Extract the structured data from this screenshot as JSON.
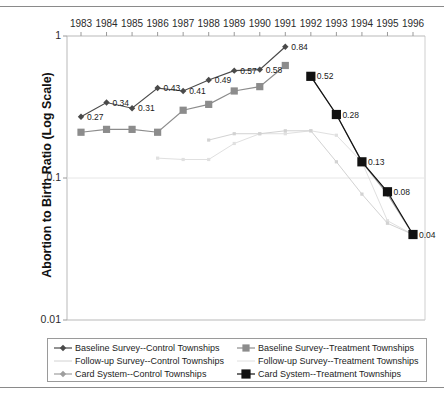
{
  "chart_data": {
    "type": "line",
    "title": "",
    "xlabel": "",
    "ylabel": "Abortion to Birth Ratio (Log Scale)",
    "scale": "log",
    "grid": false,
    "legend_position": "bottom",
    "x": [
      1983,
      1984,
      1985,
      1986,
      1987,
      1988,
      1989,
      1990,
      1991,
      1992,
      1993,
      1994,
      1995,
      1996
    ],
    "xticklabels": [
      "1983",
      "1984",
      "1985",
      "1986",
      "1987",
      "1988",
      "1989",
      "1990",
      "1991",
      "1992",
      "1993",
      "1994",
      "1995",
      "1996"
    ],
    "yticklabels": [
      "1",
      "0.1",
      "0.01"
    ],
    "yticks": [
      1,
      0.1,
      0.01
    ],
    "ylim": [
      0.01,
      1
    ],
    "series": [
      {
        "name": "Baseline Survey--Control Townships",
        "marker": "diamond",
        "color": "#4a4a4a",
        "x": [
          1983,
          1984,
          1985,
          1986,
          1987,
          1988,
          1989,
          1990,
          1991
        ],
        "values": [
          0.27,
          0.34,
          0.31,
          0.43,
          0.41,
          0.49,
          0.57,
          0.58,
          0.84
        ],
        "labels": [
          "0.27",
          "0.34",
          "0.31",
          "0.43",
          "0.41",
          "0.49",
          "0.57",
          "0.58",
          "0.84"
        ]
      },
      {
        "name": "Baseline Survey--Treatment Townships",
        "marker": "square",
        "color": "#8c8c8c",
        "x": [
          1983,
          1984,
          1985,
          1986,
          1987,
          1988,
          1989,
          1990,
          1991
        ],
        "values": [
          0.21,
          0.22,
          0.22,
          0.21,
          0.3,
          0.33,
          0.41,
          0.44,
          0.62
        ],
        "labels": [
          "",
          "",
          "",
          "",
          "",
          "",
          "",
          "",
          ""
        ]
      },
      {
        "name": "Follow-up Survey--Control Townships",
        "marker": "none",
        "color": "#d2d2d2",
        "x": [
          1988,
          1989,
          1990,
          1991,
          1992,
          1993,
          1994,
          1995,
          1996
        ],
        "values": [
          0.185,
          0.205,
          0.205,
          0.215,
          0.215,
          0.13,
          0.077,
          0.048,
          0.04
        ],
        "labels": [
          "",
          "",
          "",
          "",
          "",
          "",
          "",
          "",
          ""
        ]
      },
      {
        "name": "Follow-up Survey--Treatment Townships",
        "marker": "none",
        "color": "#e0e0e0",
        "x": [
          1986,
          1987,
          1988,
          1989,
          1990,
          1991,
          1992,
          1993,
          1994,
          1995,
          1996
        ],
        "values": [
          0.138,
          0.135,
          0.135,
          0.175,
          0.205,
          0.205,
          0.215,
          0.2,
          0.13,
          0.05,
          0.04
        ],
        "labels": [
          "",
          "",
          "",
          "",
          "",
          "",
          "",
          "",
          "",
          "",
          ""
        ]
      },
      {
        "name": "Card System--Control Townships",
        "marker": "diamond",
        "color": "#9e9e9e",
        "x": [
          1992,
          1993,
          1994,
          1995,
          1996
        ],
        "values": [
          0.52,
          0.28,
          0.13,
          0.077,
          0.04
        ],
        "labels": [
          "",
          "",
          "",
          "",
          ""
        ]
      },
      {
        "name": "Card System--Treatment Townships",
        "marker": "square-filled",
        "color": "#111111",
        "x": [
          1992,
          1993,
          1994,
          1995,
          1996
        ],
        "values": [
          0.52,
          0.28,
          0.13,
          0.08,
          0.04
        ],
        "labels": [
          "0.52",
          "0.28",
          "0.13",
          "0.08",
          "0.04"
        ]
      }
    ],
    "point_labels": [
      {
        "text": "0.27",
        "x": 1983,
        "y": 0.27
      },
      {
        "text": "0.34",
        "x": 1984,
        "y": 0.34
      },
      {
        "text": "0.31",
        "x": 1985,
        "y": 0.31
      },
      {
        "text": "0.43",
        "x": 1986,
        "y": 0.43
      },
      {
        "text": "0.41",
        "x": 1987,
        "y": 0.41
      },
      {
        "text": "0.49",
        "x": 1988,
        "y": 0.49
      },
      {
        "text": "0.57",
        "x": 1989,
        "y": 0.57
      },
      {
        "text": "0.58",
        "x": 1990,
        "y": 0.58
      },
      {
        "text": "0.84",
        "x": 1991,
        "y": 0.84
      },
      {
        "text": "0.52",
        "x": 1992,
        "y": 0.52
      },
      {
        "text": "0.28",
        "x": 1993,
        "y": 0.28
      },
      {
        "text": "0.13",
        "x": 1994,
        "y": 0.13
      },
      {
        "text": "0.08",
        "x": 1995,
        "y": 0.08
      },
      {
        "text": "0.04",
        "x": 1996,
        "y": 0.04
      }
    ]
  },
  "legend": {
    "entries": [
      {
        "label": "Baseline Survey--Control Townships",
        "marker": "diamond",
        "color": "#4a4a4a"
      },
      {
        "label": "Baseline Survey--Treatment Townships",
        "marker": "square",
        "color": "#8c8c8c"
      },
      {
        "label": "Follow-up Survey--Control Townships",
        "marker": "none",
        "color": "#d2d2d2"
      },
      {
        "label": "Follow-up Survey--Treatment Townships",
        "marker": "none",
        "color": "#e0e0e0"
      },
      {
        "label": "Card System--Control Townships",
        "marker": "diamond",
        "color": "#9e9e9e"
      },
      {
        "label": "Card System--Treatment Townships",
        "marker": "square-filled",
        "color": "#111111"
      }
    ]
  }
}
